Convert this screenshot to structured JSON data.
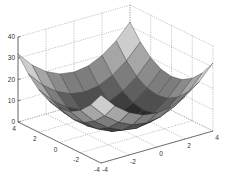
{
  "chart_data": {
    "type": "surface3d",
    "title": "",
    "function": "z = x^2 + y^2",
    "xlabel": "",
    "ylabel": "",
    "zlabel": "",
    "x_range": [
      -4,
      4
    ],
    "y_range": [
      -4,
      4
    ],
    "zlim": [
      0,
      40
    ],
    "mesh_step": 1,
    "x_ticks": [
      -4,
      -2,
      0,
      2,
      4
    ],
    "y_ticks": [
      -4,
      -2,
      0,
      2,
      4
    ],
    "z_ticks": [
      0,
      10,
      20,
      30,
      40
    ],
    "x_tick_labels": [
      "-4",
      "-2",
      "0",
      "2",
      "4"
    ],
    "y_tick_labels": [
      "4",
      "2",
      "0",
      "-2",
      "-4"
    ],
    "z_tick_labels": [
      "0",
      "10",
      "20",
      "30",
      "40"
    ],
    "grid": true,
    "colormap": "gray",
    "shading": "faceted",
    "legend": null,
    "z_values_sample": {
      "corners": 32,
      "center": 0,
      "edge_midpoints": 16
    }
  },
  "colors": {
    "background": "#ffffff",
    "axis": "#555555",
    "grid": "#9a9a9a",
    "edge": "#2a2a2a",
    "colormap_low": "#000000",
    "colormap_high": "#ffffff"
  }
}
